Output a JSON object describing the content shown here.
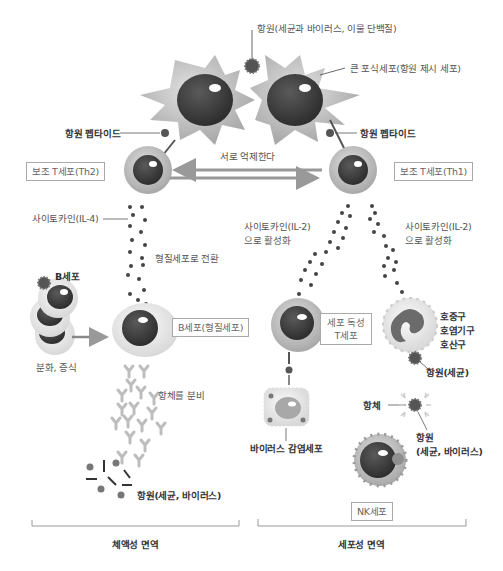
{
  "header": {
    "cut_off_title": "가 쓰러져 오지 않도록 면역 세포가 면역 반응을 조절하는 면역 시스템 - 특정 항원에 대응하는 면역 세포의 활동"
  },
  "labels": {
    "antigen_top": "항원(세균과 바이러스, 이물 단백질)",
    "macrophage": "큰 포식세포(항원 제시 세포)",
    "peptide_left": "항원 펩타이드",
    "peptide_right": "항원 펩타이드",
    "mutual_suppression": "서로 억제한다",
    "th2": "보조 T세포(Th2)",
    "th1": "보조 T세포(Th1)",
    "cytokine_il4": "사이토카인(IL-4)",
    "cytokine_il2_mid_1": "사이토카인(IL-2)",
    "cytokine_il2_mid_2": "으로 활성화",
    "cytokine_il2_right_1": "사이토카인(IL-2)",
    "cytokine_il2_right_2": "으로 활성화",
    "plasma_conversion": "형질세포로 전환",
    "b_cell": "B세포",
    "b_cell_plasma": "B세포(형질세포)",
    "differentiation": "분화, 증식",
    "antibody_secretion": "항체를 분비",
    "antigen_bottom_left": "항원(세균, 바이러스)",
    "cytotoxic_t_1": "세포 독성",
    "cytotoxic_t_2": "T세포",
    "granulocytes": [
      "호중구",
      "호염기구",
      "호산구"
    ],
    "antigen_bacteria": "항원(세균)",
    "antibody": "항체",
    "antigen_right_1": "항원",
    "antigen_right_2": "(세균, 바이러스)",
    "virus_infected_cell": "바이러스 감염세포",
    "nk_cell": "NK세포"
  },
  "sections": {
    "humoral": "체액성 면역",
    "cellular": "세포성 면역"
  },
  "colors": {
    "cell_body": "#b9b9b9",
    "nucleus": "#4a4a4a",
    "dot": "#444444",
    "arrow": "#999999",
    "antibody": "#bdbdbd",
    "box_border": "#aaaaaa"
  }
}
